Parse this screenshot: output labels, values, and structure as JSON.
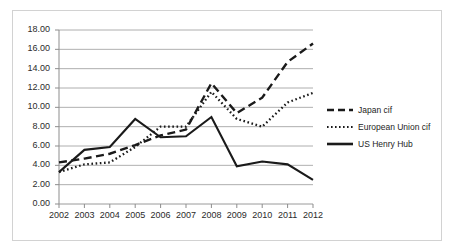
{
  "chart_data": {
    "type": "line",
    "title": "",
    "subtitle": "",
    "xlabel": "",
    "ylabel": "",
    "categories": [
      "2002",
      "2003",
      "2004",
      "2005",
      "2006",
      "2007",
      "2008",
      "2009",
      "2010",
      "2011",
      "2012"
    ],
    "x": [
      2002,
      2003,
      2004,
      2005,
      2006,
      2007,
      2008,
      2009,
      2010,
      2011,
      2012
    ],
    "ylim": [
      0.0,
      18.0
    ],
    "ytick_step": 2.0,
    "ytick_labels": [
      "0.00",
      "2.00",
      "4.00",
      "6.00",
      "8.00",
      "10.00",
      "12.00",
      "14.00",
      "16.00",
      "18.00"
    ],
    "ytick_values": [
      0.0,
      2.0,
      4.0,
      6.0,
      8.0,
      10.0,
      12.0,
      14.0,
      16.0,
      18.0
    ],
    "grid": "horizontal",
    "legend_position": "right",
    "series": [
      {
        "name": "Japan cif",
        "style": "dashed",
        "color": "#1a1a1a",
        "values": [
          4.3,
          4.7,
          5.2,
          6.1,
          7.1,
          7.7,
          12.5,
          9.4,
          11.0,
          14.7,
          16.6
        ]
      },
      {
        "name": "European Union cif",
        "style": "dotted",
        "color": "#1a1a1a",
        "values": [
          3.3,
          4.1,
          4.3,
          5.9,
          8.0,
          8.0,
          11.6,
          8.8,
          8.0,
          10.5,
          11.5
        ]
      },
      {
        "name": "US Henry Hub",
        "style": "solid",
        "color": "#1a1a1a",
        "values": [
          3.3,
          5.6,
          5.9,
          8.8,
          6.9,
          7.0,
          9.0,
          3.9,
          4.4,
          4.1,
          2.5
        ]
      }
    ]
  },
  "legend": {
    "items": [
      {
        "label": "Japan cif",
        "style": "dashed"
      },
      {
        "label": "European Union cif",
        "style": "dotted"
      },
      {
        "label": "US Henry Hub",
        "style": "solid"
      }
    ]
  }
}
